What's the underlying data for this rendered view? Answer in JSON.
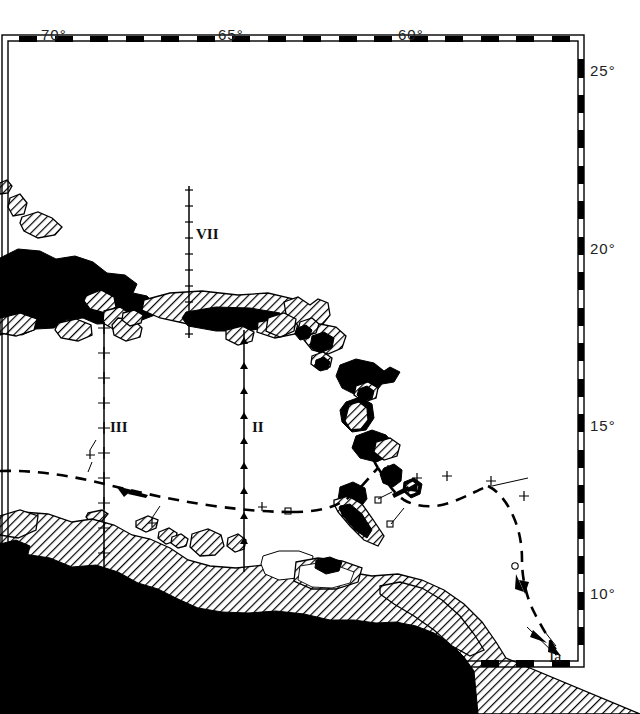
{
  "figure": {
    "kind": "bathymetric-cruise-track-map",
    "region_title": "Caribbean Sea"
  },
  "axes": {
    "top": {
      "name": "longitude-axis-top",
      "labels": [
        {
          "text": "70°",
          "x": 55
        },
        {
          "text": "65°",
          "x": 232
        },
        {
          "text": "60°",
          "x": 412
        }
      ]
    },
    "right": {
      "name": "latitude-axis-right",
      "labels": [
        {
          "text": "25°",
          "x": 598,
          "y": 70
        },
        {
          "text": "20°",
          "x": 598,
          "y": 247
        },
        {
          "text": "15°",
          "x": 598,
          "y": 424
        },
        {
          "text": "10°",
          "x": 598,
          "y": 592
        }
      ]
    },
    "frame": {
      "left": 8,
      "top": 41,
      "right": 578,
      "bottom": 661,
      "degree_px_x": 35.4,
      "degree_px_y": 35.4
    }
  },
  "profiles": [
    {
      "name": "profile-vii",
      "label": "VII",
      "x": 200,
      "y": 235
    },
    {
      "name": "profile-iii",
      "label": "III",
      "x": 113,
      "y": 428
    },
    {
      "name": "profile-ii",
      "label": "II",
      "x": 256,
      "y": 428
    }
  ],
  "track": {
    "name": "cruise-track",
    "label": "Ia",
    "label_x": 551,
    "label_y": 658,
    "style": "dashed-with-arrows"
  },
  "colors": {
    "ink": "#000000",
    "paper": "#ffffff",
    "land_fill": "#000000",
    "shelf_hatch": "#000000"
  }
}
